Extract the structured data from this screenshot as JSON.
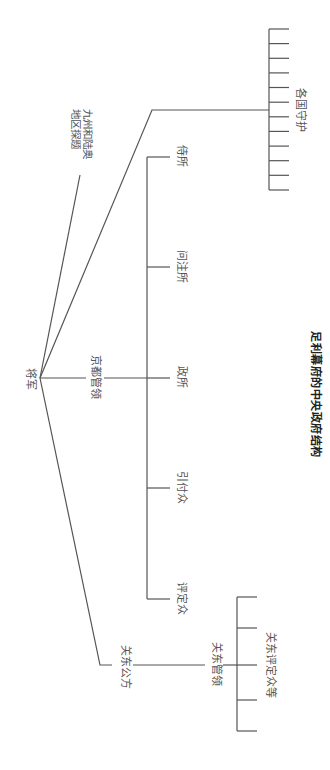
{
  "diagram": {
    "orientation": "rotated-90-clockwise",
    "caption": "足利幕府的中央政府结构",
    "root": {
      "label": "将军"
    },
    "branches": {
      "kyushu": {
        "label_line1": "九州和陆奥",
        "label_line2": "地区探题"
      },
      "kyoto": {
        "label": "京都管领",
        "children": [
          {
            "label": "侍所"
          },
          {
            "label": "问注所"
          },
          {
            "label": "政所"
          },
          {
            "label": "引付众"
          },
          {
            "label": "评定众"
          }
        ]
      },
      "provinces": {
        "label": "各国守护",
        "tick_count": 12
      },
      "kanto": {
        "label": "关东公方",
        "sub": {
          "label": "关东管领",
          "group_label": "关东评定众等",
          "tick_count": 5
        }
      }
    },
    "colors": {
      "line": "#555555",
      "text": "#555555",
      "caption": "#222222",
      "background": "#ffffff"
    }
  }
}
